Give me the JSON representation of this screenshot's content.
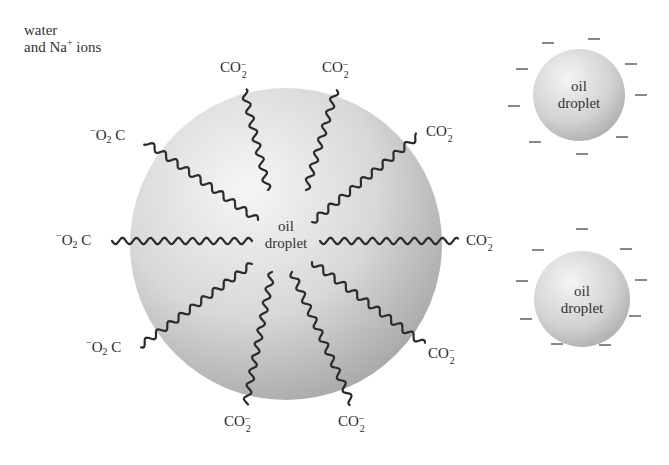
{
  "caption": {
    "line1": "water",
    "line2_prefix": "and Na",
    "line2_sup": "+",
    "line2_suffix": " ions"
  },
  "large_droplet": {
    "label_line1": "oil",
    "label_line2": "droplet",
    "center": [
      286,
      244
    ],
    "radius": 156,
    "colors": {
      "light": "#f4f4f4",
      "mid": "#d6d6d6",
      "dark": "#a8a8a8"
    }
  },
  "carboxylate_labels": {
    "right": {
      "main": "CO",
      "sub": "2",
      "charge": "−"
    },
    "left": {
      "charge": "−",
      "main": "O",
      "sub": "2",
      "tail": "C"
    }
  },
  "chains": [
    {
      "id": "top-left",
      "from": [
        268,
        190
      ],
      "to": [
        244,
        90
      ],
      "head": "CO2-",
      "label_pos": [
        220,
        60
      ]
    },
    {
      "id": "top-right",
      "from": [
        306,
        190
      ],
      "to": [
        336,
        90
      ],
      "head": "CO2-",
      "label_pos": [
        322,
        60
      ]
    },
    {
      "id": "upper-right",
      "from": [
        312,
        222
      ],
      "to": [
        418,
        136
      ],
      "head": "CO2-",
      "label_pos": [
        426,
        124
      ]
    },
    {
      "id": "right",
      "from": [
        320,
        241
      ],
      "to": [
        458,
        241
      ],
      "head": "CO2-",
      "label_pos": [
        466,
        233
      ]
    },
    {
      "id": "lower-right",
      "from": [
        312,
        262
      ],
      "to": [
        424,
        344
      ],
      "head": "CO2-",
      "label_pos": [
        428,
        346
      ]
    },
    {
      "id": "bottom-right",
      "from": [
        292,
        272
      ],
      "to": [
        352,
        404
      ],
      "head": "CO2-",
      "label_pos": [
        338,
        414
      ]
    },
    {
      "id": "bottom-left",
      "from": [
        272,
        272
      ],
      "to": [
        246,
        404
      ],
      "head": "CO2-",
      "label_pos": [
        224,
        414
      ]
    },
    {
      "id": "lower-left",
      "from": [
        252,
        264
      ],
      "to": [
        140,
        346
      ],
      "head": "-O2C",
      "label_pos": [
        86,
        340
      ]
    },
    {
      "id": "left",
      "from": [
        252,
        241
      ],
      "to": [
        112,
        241
      ],
      "head": "-O2C",
      "label_pos": [
        56,
        233
      ]
    },
    {
      "id": "upper-left",
      "from": [
        258,
        220
      ],
      "to": [
        146,
        142
      ],
      "head": "-O2C",
      "label_pos": [
        90,
        128
      ]
    }
  ],
  "small_droplets": [
    {
      "id": "small-droplet-top",
      "label_line1": "oil",
      "label_line2": "droplet",
      "center": [
        579,
        95
      ],
      "radius": 46,
      "charges": [
        [
          548,
          43
        ],
        [
          594,
          39
        ],
        [
          522,
          69
        ],
        [
          631,
          64
        ],
        [
          514,
          106
        ],
        [
          641,
          95
        ],
        [
          535,
          142
        ],
        [
          622,
          137
        ],
        [
          582,
          154
        ]
      ]
    },
    {
      "id": "small-droplet-bottom",
      "label_line1": "oil",
      "label_line2": "droplet",
      "center": [
        582,
        299
      ],
      "radius": 48,
      "charges": [
        [
          582,
          229
        ],
        [
          538,
          250
        ],
        [
          626,
          249
        ],
        [
          522,
          281
        ],
        [
          641,
          280
        ],
        [
          526,
          319
        ],
        [
          635,
          316
        ],
        [
          557,
          344
        ],
        [
          605,
          345
        ]
      ]
    }
  ],
  "charge_symbol": "−"
}
